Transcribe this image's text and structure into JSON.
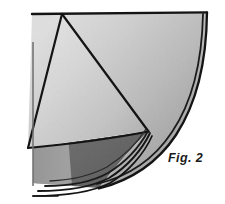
{
  "figure": {
    "caption": "Fig. 2",
    "kind": "geometric-folding-diagram",
    "canvas": {
      "width": 225,
      "height": 204
    },
    "colors": {
      "background": "#ffffff",
      "ink": "#141414",
      "quarter_fill_light": "#e4e4e4",
      "quarter_fill_mid": "#d2d2d2",
      "triangle_fill_light": "#ececec",
      "triangle_fill_mid": "#dcdcdc",
      "underlayer_fill": "#a9a9a9",
      "underlayer_fill_dark": "#8e8e8e",
      "shadow_edge": "#6f6f6f"
    },
    "stroke_widths": {
      "outline": 2.3,
      "arc": 2.0,
      "thin_arc": 1.5,
      "fold": 2.0
    },
    "geometry": {
      "top_edge": {
        "x1": 32,
        "y1": 14,
        "x2": 207,
        "y2": 12
      },
      "corner_top_left": {
        "x": 32,
        "y": 14
      },
      "corner_top_right": {
        "x": 207,
        "y": 12
      },
      "arc_outer_end": {
        "x": 99,
        "y": 188
      },
      "triangle_apex": {
        "x": 62,
        "y": 14
      },
      "triangle_left": {
        "x": 28,
        "y": 148
      },
      "triangle_right": {
        "x": 148,
        "y": 131
      },
      "underlayer_bottom_left": {
        "x": 33,
        "y": 183
      },
      "arc_count": 4
    }
  }
}
